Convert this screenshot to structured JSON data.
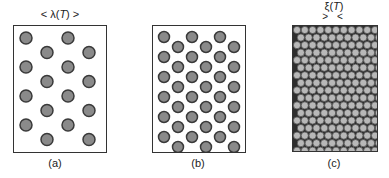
{
  "figure": {
    "panels": [
      {
        "id": "a",
        "caption": "(a)",
        "dimension_label": "< λ(T) >",
        "dimension_symbol": "λ",
        "dimension_arg": "T",
        "description": "sparse triangular lattice of vortices",
        "background": "#ffffff",
        "dot_fill": "#8a8a8a",
        "dot_stroke": "#3a3a3a"
      },
      {
        "id": "b",
        "caption": "(b)",
        "description": "denser triangular lattice of vortices",
        "background": "#ffffff",
        "dot_fill": "#8a8a8a",
        "dot_stroke": "#3a3a3a"
      },
      {
        "id": "c",
        "caption": "(c)",
        "dimension_label": "ξ(T)",
        "dimension_symbol": "ξ",
        "dimension_arg": "T",
        "arrows": "> <",
        "description": "very dense close-packed vortex lattice",
        "background": "#2e2e2e",
        "dot_fill": "#b8b8b8",
        "dot_stroke": "#555555"
      }
    ]
  }
}
